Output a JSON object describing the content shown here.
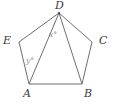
{
  "figure": {
    "kind": "geometry-diagram",
    "background_color": "#ffffff",
    "stroke_color": "#6e6e6e",
    "label_color": "#3a3a3a",
    "angle_label_color": "#8a8a8a",
    "vertices": [
      {
        "name": "D",
        "label": "D",
        "x": 59,
        "y": 13
      },
      {
        "name": "E",
        "label": "E",
        "x": 19,
        "y": 42
      },
      {
        "name": "C",
        "label": "C",
        "x": 92,
        "y": 42
      },
      {
        "name": "A",
        "label": "A",
        "x": 29,
        "y": 84
      },
      {
        "name": "B",
        "label": "B",
        "x": 82,
        "y": 84
      }
    ],
    "pentagon_path": "M 59 13 L 92 42 L 82 84 L 29 84 L 19 42 Z",
    "diagonals": [
      {
        "name": "diagonal-D-A",
        "from": "D",
        "to": "A",
        "path": "M 59 13 L 29 84"
      },
      {
        "name": "diagonal-D-B",
        "from": "D",
        "to": "B",
        "path": "M 59 13 L 82 84"
      }
    ],
    "angle_labels": [
      {
        "name": "angle-x",
        "text": "x°",
        "at_vertex": "D",
        "x": 49,
        "y": 31
      },
      {
        "name": "angle-y",
        "text": "y°",
        "at_vertex": "A",
        "x": 26,
        "y": 57
      }
    ]
  },
  "labels": {
    "D": "D",
    "E": "E",
    "C": "C",
    "A": "A",
    "B": "B",
    "x_angle": "x°",
    "y_angle": "y°"
  }
}
